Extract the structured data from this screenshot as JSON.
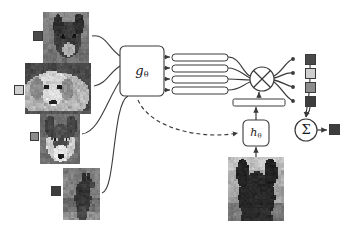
{
  "figure": {
    "name": "few-shot-matching-network-diagram",
    "background": "#ffffff",
    "width": 349,
    "height": 227
  },
  "palette": {
    "stroke": "#3a3a3a",
    "stroke_light": "#6d6d6d",
    "box_fill": "#ffffff",
    "bar_fill": "#ffffff",
    "label_dark": "#4a4a4a",
    "label_mid": "#8c8c8c",
    "label_light": "#cfcfcf",
    "label_darkest": "#3d3d3d",
    "text": "#1a1a1a"
  },
  "modules": {
    "embedding": {
      "label": "g",
      "subscript": "θ",
      "name": "g-theta-encoder",
      "x": 120,
      "y": 46,
      "w": 44,
      "h": 50
    },
    "query_encoder": {
      "label": "h",
      "subscript": "θ",
      "name": "h-theta-encoder",
      "x": 243,
      "y": 120,
      "w": 26,
      "h": 26
    },
    "attention": {
      "symbol": "⊗",
      "name": "attention-multiply-node",
      "cx": 262,
      "cy": 79,
      "r": 12
    },
    "sum": {
      "symbol": "Σ",
      "name": "sum-node",
      "cx": 306,
      "cy": 130,
      "r": 11
    }
  },
  "support_set": {
    "name": "support-set",
    "count": 4,
    "items": [
      {
        "name": "support-image-1",
        "caption": "chihuahua",
        "x": 43,
        "y": 12,
        "w": 46,
        "h": 51,
        "label_square": {
          "x": 33,
          "y": 31,
          "size": 10,
          "fill": "#4a4a4a",
          "name": "support-label-1"
        },
        "seed": 11,
        "scene": "chihuahua"
      },
      {
        "name": "support-image-2",
        "caption": "golden retriever",
        "x": 25,
        "y": 63,
        "w": 66,
        "h": 51,
        "label_square": {
          "x": 14,
          "y": 85,
          "size": 10,
          "fill": "#cfcfcf",
          "name": "support-label-2"
        },
        "seed": 23,
        "scene": "retriever"
      },
      {
        "name": "support-image-3",
        "caption": "husky",
        "x": 40,
        "y": 114,
        "w": 40,
        "h": 50,
        "label_square": {
          "x": 30,
          "y": 132,
          "size": 9,
          "fill": "#8c8c8c",
          "name": "support-label-3"
        },
        "seed": 37,
        "scene": "husky"
      },
      {
        "name": "support-image-4",
        "caption": "german shepherd",
        "x": 63,
        "y": 168,
        "w": 37,
        "h": 52,
        "label_square": {
          "x": 51,
          "y": 186,
          "size": 10,
          "fill": "#3d3d3d",
          "name": "support-label-4"
        },
        "seed": 53,
        "scene": "shepherd"
      }
    ]
  },
  "query": {
    "name": "query-image",
    "caption": "query dog silhouette",
    "x": 228,
    "y": 157,
    "w": 56,
    "h": 64,
    "seed": 71,
    "scene": "query"
  },
  "embedding_bars": {
    "name": "support-embedding-vectors",
    "count": 4,
    "x": 172,
    "w": 56,
    "h": 7,
    "ys": [
      54,
      65,
      76,
      87
    ],
    "fill": "#ffffff"
  },
  "query_bar": {
    "name": "query-embedding-vector",
    "x": 233,
    "y": 99,
    "w": 52,
    "h": 7,
    "fill": "#ffffff"
  },
  "attention_outputs": {
    "name": "attention-weighted-labels",
    "items": [
      {
        "name": "output-label-1",
        "x": 305,
        "y": 54,
        "size": 11,
        "fill": "#4a4a4a",
        "dot_x": 293,
        "dot_y": 59
      },
      {
        "name": "output-label-2",
        "x": 305,
        "y": 68,
        "size": 11,
        "fill": "#cfcfcf",
        "dot_x": 293,
        "dot_y": 73
      },
      {
        "name": "output-label-3",
        "x": 305,
        "y": 82,
        "size": 11,
        "fill": "#8c8c8c",
        "dot_x": 293,
        "dot_y": 87
      },
      {
        "name": "output-label-4",
        "x": 305,
        "y": 96,
        "size": 11,
        "fill": "#3d3d3d",
        "dot_x": 293,
        "dot_y": 101
      }
    ]
  },
  "prediction": {
    "name": "predicted-label",
    "x": 329,
    "y": 124,
    "size": 11,
    "fill": "#3d3d3d"
  },
  "connections": {
    "support_to_encoder": [
      "M 92,36 C 106,34 108,48 120,56",
      "M 94,86 C 106,84 110,72 120,66",
      "M 82,134 C 100,132 108,96 122,78",
      "M 102,193 C 116,190 112,104 128,96"
    ],
    "encoder_to_bars": [
      "M 164,57 L 170,57",
      "M 164,68 L 170,68",
      "M 164,79 L 170,79",
      "M 164,90 L 170,90"
    ],
    "bars_to_attention": [
      "M 228,57 C 240,57 242,72 250,76",
      "M 228,68 C 238,68 242,74 250,78",
      "M 228,79 C 238,79 244,80 250,80",
      "M 228,90 C 240,90 242,85 250,82"
    ],
    "attention_to_outputs": [
      "M 274,76 C 282,72 286,61 293,59",
      "M 274,78 C 282,76 286,72 293,73",
      "M 274,80 C 282,82 286,85 293,87",
      "M 274,82 C 282,88 286,98 293,101"
    ],
    "outputs_to_sum": [
      "M 310,65 C 311,98 306,106 306,117",
      "M 310,107 C 310,112 307,114 306,117"
    ],
    "query_to_encoder": "M 256,157 L 256,147",
    "query_encoder_to_bar": "M 256,120 L 256,107",
    "querybar_to_attention": "M 259,98 L 259,92",
    "sum_to_prediction": "M 317,130 L 327,130",
    "feedback_dashed": "M 138,100 C 150,128 200,140 238,133"
  }
}
